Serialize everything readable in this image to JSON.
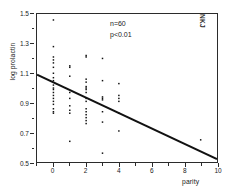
{
  "chart_data": {
    "type": "scatter",
    "title": "",
    "xlabel": "parity",
    "ylabel": "log prolactin",
    "xlim": [
      -1,
      10
    ],
    "ylim": [
      0.5,
      1.5
    ],
    "grid": false,
    "legend_position": "none",
    "xticks": [
      0,
      2,
      4,
      6,
      8,
      10
    ],
    "xtick_labels": [
      "0",
      "2",
      "4",
      "6",
      "8",
      "10"
    ],
    "xminor_ticks": [
      -1,
      1,
      3,
      5,
      7,
      9
    ],
    "yticks": [
      0.5,
      0.7,
      0.9,
      1.1,
      1.3,
      1.5
    ],
    "ytick_labels": [
      "0.5",
      "0.7",
      "0.9",
      "1.1",
      "1.3",
      "1.5"
    ],
    "yminor_ticks": [
      0.6,
      0.8,
      1.0,
      1.2,
      1.4
    ],
    "annotations": [
      "n=60",
      "p<0.01"
    ],
    "corner_label": "NKJ",
    "series": [
      {
        "name": "log prolactin vs parity",
        "marker": "dot",
        "color": "#111111",
        "points": [
          [
            0,
            1.46
          ],
          [
            0,
            1.28
          ],
          [
            0,
            1.21
          ],
          [
            0,
            1.19
          ],
          [
            0,
            1.17
          ],
          [
            0,
            1.14
          ],
          [
            0,
            1.1
          ],
          [
            0,
            1.07
          ],
          [
            0,
            1.05
          ],
          [
            0,
            1.02
          ],
          [
            0,
            1.0
          ],
          [
            0,
            0.99
          ],
          [
            0,
            0.97
          ],
          [
            0,
            0.95
          ],
          [
            0,
            0.93
          ],
          [
            0,
            0.91
          ],
          [
            0,
            0.89
          ],
          [
            0,
            0.86
          ],
          [
            0,
            0.84
          ],
          [
            0,
            0.83
          ],
          [
            1,
            1.15
          ],
          [
            1,
            1.14
          ],
          [
            1,
            1.08
          ],
          [
            1,
            0.97
          ],
          [
            1,
            0.93
          ],
          [
            1,
            0.88
          ],
          [
            1,
            0.85
          ],
          [
            1,
            0.83
          ],
          [
            1,
            0.64
          ],
          [
            2,
            1.22
          ],
          [
            2,
            1.21
          ],
          [
            2,
            1.06
          ],
          [
            2,
            1.04
          ],
          [
            2,
            1.01
          ],
          [
            2,
            1.0
          ],
          [
            2,
            0.99
          ],
          [
            2,
            0.97
          ],
          [
            2,
            0.93
          ],
          [
            2,
            0.91
          ],
          [
            2,
            0.86
          ],
          [
            2,
            0.84
          ],
          [
            2,
            0.82
          ],
          [
            2,
            0.8
          ],
          [
            2,
            0.78
          ],
          [
            2,
            0.76
          ],
          [
            3,
            1.2
          ],
          [
            3,
            1.05
          ],
          [
            3,
            0.94
          ],
          [
            3,
            0.93
          ],
          [
            3,
            0.92
          ],
          [
            3,
            0.84
          ],
          [
            3,
            0.77
          ],
          [
            3,
            0.56
          ],
          [
            4,
            1.03
          ],
          [
            4,
            0.95
          ],
          [
            4,
            0.93
          ],
          [
            4,
            0.91
          ],
          [
            4,
            0.83
          ],
          [
            4,
            0.71
          ],
          [
            9,
            0.65
          ]
        ]
      }
    ],
    "trendline": {
      "name": "regression-line",
      "color": "#111111",
      "x_start": -1,
      "y_start": 1.09,
      "x_end": 10,
      "y_end": 0.52
    }
  }
}
